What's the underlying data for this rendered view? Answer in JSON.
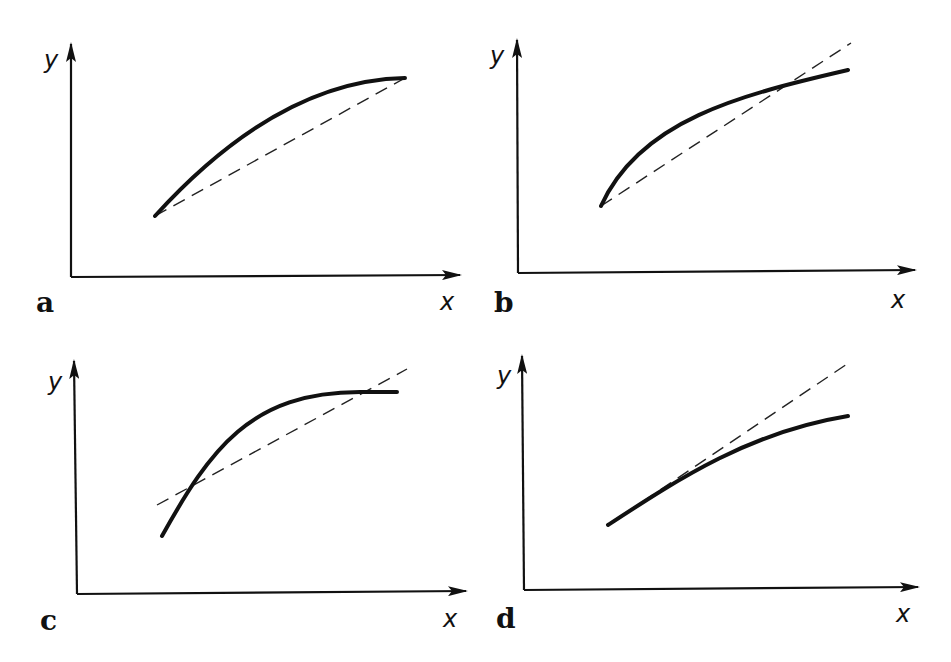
{
  "figure": {
    "panels": [
      {
        "id": "a",
        "label": "a",
        "x_label": "x",
        "y_label": "y",
        "description": "Concave curve lying entirely above the dashed chord joining its endpoints"
      },
      {
        "id": "b",
        "label": "b",
        "x_label": "x",
        "y_label": "y",
        "description": "Concave curve starting at common point with dashed line, crossing it near the right end"
      },
      {
        "id": "c",
        "label": "c",
        "x_label": "x",
        "y_label": "y",
        "description": "Steep concave curve crossing the dashed line twice"
      },
      {
        "id": "d",
        "label": "d",
        "x_label": "x",
        "y_label": "y",
        "description": "Concave curve tangent to dashed line at the left, falling below it to the right"
      }
    ]
  },
  "colors": {
    "ink": "#111111",
    "background": "#ffffff"
  }
}
